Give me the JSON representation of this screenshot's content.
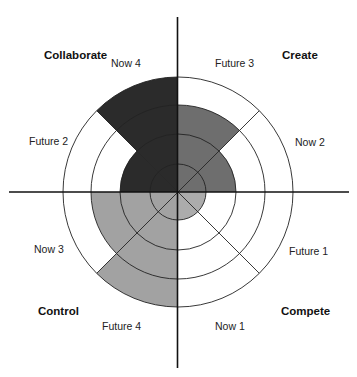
{
  "diagram": {
    "type": "radial-quadrant-maturity",
    "center": {
      "x": 178,
      "y": 192
    },
    "ring_radii": [
      28,
      58,
      87,
      115
    ],
    "quadrants": [
      {
        "name": "Create",
        "position": "top-right",
        "color": "#6e6e6e",
        "segments": [
          {
            "label": "Future 3",
            "level": 3,
            "side": "vertical"
          },
          {
            "label": "Now 2",
            "level": 2,
            "side": "horizontal"
          }
        ]
      },
      {
        "name": "Compete",
        "position": "bottom-right",
        "color": "#acacac",
        "segments": [
          {
            "label": "Future 1",
            "level": 1,
            "side": "horizontal"
          },
          {
            "label": "Now 1",
            "level": 1,
            "side": "vertical"
          }
        ]
      },
      {
        "name": "Control",
        "position": "bottom-left",
        "color": "#a2a2a2",
        "segments": [
          {
            "label": "Future 4",
            "level": 4,
            "side": "vertical"
          },
          {
            "label": "Now 3",
            "level": 3,
            "side": "horizontal"
          }
        ]
      },
      {
        "name": "Collaborate",
        "position": "top-left",
        "color": "#2b2b2b",
        "segments": [
          {
            "label": "Future 2",
            "level": 2,
            "side": "horizontal"
          },
          {
            "label": "Now 4",
            "level": 4,
            "side": "vertical"
          }
        ]
      }
    ]
  },
  "labels": {
    "collaborate": "Collaborate",
    "create": "Create",
    "control": "Control",
    "compete": "Compete",
    "now4": "Now 4",
    "future3": "Future 3",
    "future2": "Future 2",
    "now2": "Now 2",
    "now3": "Now 3",
    "future1": "Future 1",
    "future4": "Future 4",
    "now1": "Now 1"
  }
}
